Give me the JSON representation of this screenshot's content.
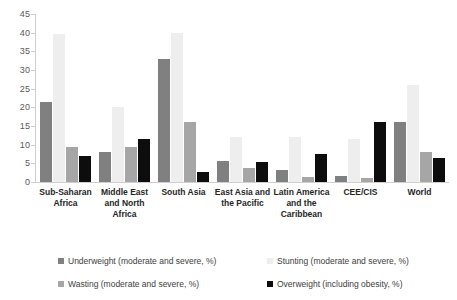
{
  "chart_data": {
    "type": "bar",
    "title": "",
    "subtitle": "",
    "xlabel": "",
    "ylabel": "",
    "ylim": [
      0,
      45
    ],
    "ytick_step": 5,
    "yticks": [
      45,
      40,
      35,
      30,
      25,
      20,
      15,
      10,
      5,
      0
    ],
    "grid": false,
    "legend_position": "bottom",
    "categories": [
      "Sub-Saharan Africa",
      "Middle East and North Africa",
      "South Asia",
      "East Asia and the Pacific",
      "Latin America and the Caribbean",
      "CEE/CIS",
      "World"
    ],
    "series": [
      {
        "name": "Underweight (moderate and severe, %)",
        "color": "#808080",
        "values": [
          21.5,
          8.0,
          33.0,
          5.7,
          3.2,
          1.5,
          16.0
        ]
      },
      {
        "name": "Stunting (moderate and severe, %)",
        "color": "#eeeeee",
        "values": [
          39.6,
          20.0,
          39.8,
          12.0,
          12.0,
          11.5,
          26.0
        ]
      },
      {
        "name": "Wasting (moderate and severe, %)",
        "color": "#a6a6a6",
        "values": [
          9.3,
          9.3,
          16.0,
          3.8,
          1.3,
          1.0,
          8.0
        ]
      },
      {
        "name": "Overweight (including obesity, %)",
        "color": "#0d0d0d",
        "values": [
          7.0,
          11.5,
          2.6,
          5.4,
          7.6,
          16.0,
          6.5
        ]
      }
    ]
  },
  "legend": {
    "items": [
      {
        "label": "Underweight (moderate and severe, %)",
        "color": "#808080"
      },
      {
        "label": "Stunting (moderate and severe, %)",
        "color": "#eeeeee"
      },
      {
        "label": "Wasting (moderate and severe, %)",
        "color": "#a6a6a6"
      },
      {
        "label": "Overweight (including obesity, %)",
        "color": "#0d0d0d"
      }
    ]
  },
  "axis": {
    "line_color": "#d0cece",
    "tick_label_color": "#595959"
  }
}
